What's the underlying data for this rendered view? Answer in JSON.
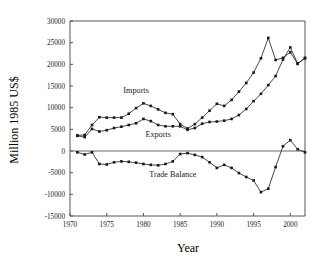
{
  "chart_data": {
    "type": "line",
    "title": "",
    "xlabel": "Year",
    "ylabel": "Million 1985 US$",
    "xlim": [
      1970,
      2002
    ],
    "ylim": [
      -15000,
      30000
    ],
    "grid": false,
    "legend_position": "inline-annotations",
    "x_ticks": [
      "1970",
      "1975",
      "1980",
      "1985",
      "1990",
      "1995",
      "2000"
    ],
    "x_tick_values": [
      1970,
      1975,
      1980,
      1985,
      1990,
      1995,
      2000
    ],
    "y_ticks": [
      "30000",
      "25000",
      "20000",
      "15000",
      "10000",
      "5000",
      "0",
      "-5000",
      "-10000",
      "-15000"
    ],
    "y_tick_values": [
      30000,
      25000,
      20000,
      15000,
      10000,
      5000,
      0,
      -5000,
      -10000,
      -15000
    ],
    "x": [
      1971,
      1972,
      1973,
      1974,
      1975,
      1976,
      1977,
      1978,
      1979,
      1980,
      1981,
      1982,
      1983,
      1984,
      1985,
      1986,
      1987,
      1988,
      1989,
      1990,
      1991,
      1992,
      1993,
      1994,
      1995,
      1996,
      1997,
      1998,
      1999,
      2000,
      2001,
      2002
    ],
    "series": [
      {
        "name": "Imports",
        "values": [
          3600,
          3700,
          6000,
          7800,
          7700,
          7700,
          7700,
          8600,
          9900,
          11000,
          10400,
          9600,
          8800,
          8500,
          6200,
          5200,
          6200,
          7700,
          9300,
          10900,
          10400,
          11800,
          13700,
          15700,
          18100,
          21400,
          26100,
          21000,
          21500,
          22800,
          20100,
          21500
        ]
      },
      {
        "name": "Exports",
        "values": [
          3500,
          3200,
          5100,
          4500,
          4800,
          5300,
          5600,
          6000,
          6400,
          7400,
          6900,
          6000,
          5700,
          5700,
          5700,
          4900,
          5300,
          6300,
          6700,
          6800,
          7000,
          7400,
          8300,
          9700,
          11500,
          13200,
          15200,
          17300,
          21100,
          23900,
          20200,
          21400
        ]
      },
      {
        "name": "Trade Balance",
        "values": [
          -300,
          -800,
          -300,
          -3000,
          -3100,
          -2600,
          -2400,
          -2500,
          -2700,
          -3000,
          -3200,
          -3300,
          -3000,
          -2400,
          -700,
          -500,
          -900,
          -1400,
          -2600,
          -3900,
          -3200,
          -3900,
          -5100,
          -6000,
          -6800,
          -9500,
          -8700,
          -3700,
          1100,
          2500,
          400,
          -300
        ]
      }
    ],
    "annotations": [
      {
        "text": "Imports",
        "x": 1979,
        "y": 13500
      },
      {
        "text": "Exports",
        "x": 1982,
        "y": 3200
      },
      {
        "text": "Trade Balance",
        "x": 1984,
        "y": -6100
      }
    ]
  }
}
